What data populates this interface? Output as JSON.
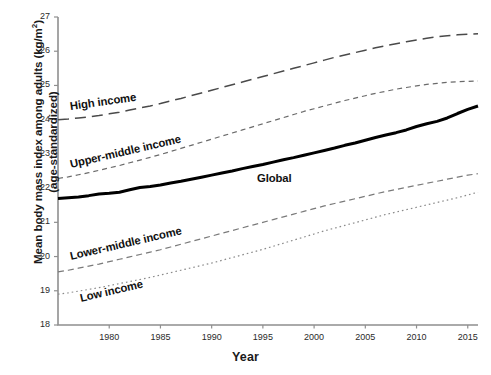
{
  "chart_data": {
    "type": "line",
    "title": "",
    "xlabel": "Year",
    "ylabel_line1": "Mean body mass index among adults (kg/m",
    "ylabel_sup": "2",
    "ylabel_line1_end": ")",
    "ylabel_line2": "(age-standardized)",
    "xlim": [
      1975,
      2016
    ],
    "ylim": [
      18,
      27
    ],
    "grid": false,
    "legend_position": "inline-annotations",
    "xticks": [
      1980,
      1985,
      1990,
      1995,
      2000,
      2005,
      2010,
      2015
    ],
    "yticks": [
      18,
      19,
      20,
      21,
      22,
      23,
      24,
      25,
      26,
      27
    ],
    "x": [
      1975,
      1976,
      1977,
      1978,
      1979,
      1980,
      1981,
      1982,
      1983,
      1984,
      1985,
      1986,
      1987,
      1988,
      1989,
      1990,
      1991,
      1992,
      1993,
      1994,
      1995,
      1996,
      1997,
      1998,
      1999,
      2000,
      2001,
      2002,
      2003,
      2004,
      2005,
      2006,
      2007,
      2008,
      2009,
      2010,
      2011,
      2012,
      2013,
      2014,
      2015,
      2016
    ],
    "series": [
      {
        "name": "High income",
        "style": "long-dash",
        "color": "#4a4a4a",
        "label_x": 70,
        "label_y": 100,
        "label_rotate": -8,
        "values": [
          24.0,
          24.02,
          24.05,
          24.08,
          24.12,
          24.17,
          24.22,
          24.28,
          24.34,
          24.4,
          24.47,
          24.55,
          24.62,
          24.7,
          24.78,
          24.86,
          24.94,
          25.02,
          25.1,
          25.18,
          25.26,
          25.34,
          25.42,
          25.5,
          25.58,
          25.66,
          25.74,
          25.82,
          25.89,
          25.96,
          26.03,
          26.1,
          26.16,
          26.22,
          26.28,
          26.33,
          26.38,
          26.42,
          26.45,
          26.48,
          26.5,
          26.51
        ]
      },
      {
        "name": "Upper-middle income",
        "style": "short-dash",
        "color": "#6a6a6a",
        "label_x": 70,
        "label_y": 158,
        "label_rotate": -13,
        "values": [
          22.28,
          22.33,
          22.39,
          22.45,
          22.52,
          22.59,
          22.66,
          22.74,
          22.82,
          22.9,
          22.98,
          23.07,
          23.16,
          23.25,
          23.34,
          23.43,
          23.52,
          23.61,
          23.7,
          23.79,
          23.88,
          23.97,
          24.06,
          24.15,
          24.24,
          24.32,
          24.4,
          24.48,
          24.56,
          24.63,
          24.7,
          24.77,
          24.83,
          24.89,
          24.94,
          24.99,
          25.03,
          25.06,
          25.09,
          25.11,
          25.12,
          25.13
        ]
      },
      {
        "name": "Global",
        "style": "solid-bold",
        "color": "#000000",
        "label_x": 257,
        "label_y": 172,
        "label_rotate": 0,
        "values": [
          21.7,
          21.72,
          21.74,
          21.78,
          21.83,
          21.85,
          21.88,
          21.95,
          22.02,
          22.05,
          22.09,
          22.15,
          22.2,
          22.26,
          22.32,
          22.38,
          22.44,
          22.5,
          22.57,
          22.63,
          22.69,
          22.76,
          22.83,
          22.89,
          22.96,
          23.03,
          23.1,
          23.17,
          23.25,
          23.32,
          23.4,
          23.48,
          23.55,
          23.62,
          23.7,
          23.8,
          23.88,
          23.95,
          24.05,
          24.18,
          24.3,
          24.4
        ]
      },
      {
        "name": "Lower-middle income",
        "style": "med-dash",
        "color": "#7a7a7a",
        "label_x": 70,
        "label_y": 250,
        "label_rotate": -13,
        "values": [
          19.55,
          19.6,
          19.66,
          19.72,
          19.78,
          19.85,
          19.92,
          19.99,
          20.06,
          20.13,
          20.2,
          20.28,
          20.36,
          20.44,
          20.52,
          20.6,
          20.68,
          20.76,
          20.84,
          20.92,
          21.0,
          21.08,
          21.16,
          21.24,
          21.32,
          21.4,
          21.48,
          21.55,
          21.62,
          21.69,
          21.76,
          21.83,
          21.9,
          21.96,
          22.02,
          22.08,
          22.14,
          22.2,
          22.26,
          22.32,
          22.38,
          22.42
        ]
      },
      {
        "name": "Low income",
        "style": "dotted",
        "color": "#8a8a8a",
        "label_x": 80,
        "label_y": 292,
        "label_rotate": -13,
        "values": [
          18.9,
          18.94,
          18.99,
          19.04,
          19.09,
          19.15,
          19.21,
          19.27,
          19.33,
          19.39,
          19.46,
          19.53,
          19.6,
          19.67,
          19.74,
          19.81,
          19.89,
          19.97,
          20.05,
          20.13,
          20.21,
          20.3,
          20.39,
          20.48,
          20.57,
          20.66,
          20.75,
          20.83,
          20.91,
          20.99,
          21.07,
          21.15,
          21.23,
          21.3,
          21.37,
          21.44,
          21.51,
          21.58,
          21.65,
          21.72,
          21.8,
          21.88
        ]
      }
    ]
  },
  "plot_geometry": {
    "left": 58,
    "right": 478,
    "top": 17,
    "bottom": 325
  }
}
